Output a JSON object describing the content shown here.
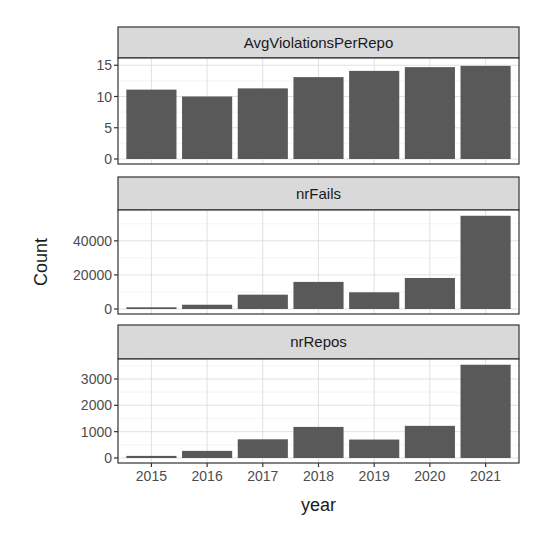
{
  "chart_data": {
    "type": "bar",
    "layout": "facet_wrap vertical, free y scales",
    "xlabel": "year",
    "ylabel": "Count",
    "categories": [
      "2015",
      "2016",
      "2017",
      "2018",
      "2019",
      "2020",
      "2021"
    ],
    "grid": true,
    "legend": null,
    "bar_color": "#595959",
    "strip_fill": "#d9d9d9",
    "panels": [
      {
        "name": "AvgViolationsPerRepo",
        "values": [
          11.1,
          10.0,
          11.3,
          13.1,
          14.1,
          14.7,
          14.9
        ],
        "yticks": [
          0,
          5,
          10,
          15
        ],
        "ylim": [
          0,
          16.0
        ]
      },
      {
        "name": "nrFails",
        "values": [
          1000,
          2500,
          8400,
          15900,
          9800,
          18200,
          54700
        ],
        "yticks": [
          0,
          20000,
          40000
        ],
        "ylim": [
          0,
          57500
        ]
      },
      {
        "name": "nrRepos",
        "values": [
          80,
          270,
          710,
          1180,
          700,
          1220,
          3540
        ],
        "yticks": [
          0,
          1000,
          2000,
          3000
        ],
        "ylim": [
          0,
          3720
        ]
      }
    ]
  }
}
